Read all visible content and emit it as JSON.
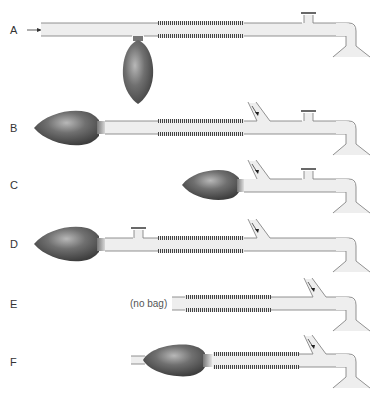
{
  "diagram": {
    "colors": {
      "tube_fill": "#eeeeee",
      "tube_edge": "#777777",
      "bag_dark": "#4a4a4a",
      "bag_light": "#b0b0b0",
      "corrugation": "#444444"
    },
    "systems": [
      {
        "label": "A",
        "bag": "side-hanging",
        "valve": "patient-end",
        "fgf_inlet": "left-end",
        "note": ""
      },
      {
        "label": "B",
        "bag": "machine-end",
        "valve": "patient-end",
        "fgf_inlet": "patient-end",
        "note": ""
      },
      {
        "label": "C",
        "bag": "machine-end",
        "valve": "patient-end",
        "fgf_inlet": "patient-end",
        "note": ""
      },
      {
        "label": "D",
        "bag": "machine-end",
        "valve": "machine-end",
        "fgf_inlet": "patient-end",
        "note": ""
      },
      {
        "label": "E",
        "bag": "none",
        "valve": "none",
        "fgf_inlet": "patient-end",
        "note": "(no bag)"
      },
      {
        "label": "F",
        "bag": "machine-end-open-tail",
        "valve": "none",
        "fgf_inlet": "patient-end",
        "note": ""
      }
    ]
  }
}
